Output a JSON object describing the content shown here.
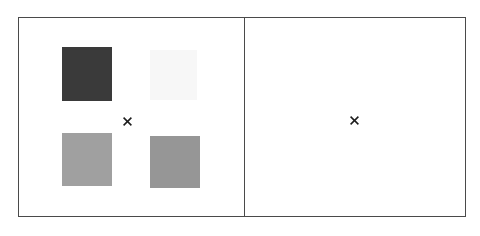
{
  "figure": {
    "background_color": "#ffffff",
    "border_color": "#4a4a4a",
    "marker_color": "#1c1c1c",
    "marker_glyph": "x"
  },
  "panels": [
    {
      "name": "left-panel",
      "label": "",
      "x": 18,
      "y": 17,
      "width": 227,
      "height": 200,
      "center_marker": {
        "label": "x",
        "cx": 127,
        "cy": 121
      },
      "swatches": [
        {
          "name": "swatch-top-left",
          "label": "",
          "color": "#3a3a3a",
          "x": 62,
          "y": 47,
          "width": 50,
          "height": 54,
          "row": 0,
          "col": 0
        },
        {
          "name": "swatch-top-right",
          "label": "",
          "color": "#f7f7f7",
          "x": 150,
          "y": 50,
          "width": 47,
          "height": 50,
          "row": 0,
          "col": 1
        },
        {
          "name": "swatch-bottom-left",
          "label": "",
          "color": "#a0a0a0",
          "x": 62,
          "y": 133,
          "width": 50,
          "height": 53,
          "row": 1,
          "col": 0
        },
        {
          "name": "swatch-bottom-right",
          "label": "",
          "color": "#969696",
          "x": 150,
          "y": 136,
          "width": 50,
          "height": 52,
          "row": 1,
          "col": 1
        }
      ]
    },
    {
      "name": "right-panel",
      "label": "",
      "x": 244,
      "y": 17,
      "width": 222,
      "height": 200,
      "center_marker": {
        "label": "x",
        "cx": 354,
        "cy": 120
      },
      "swatches": []
    }
  ]
}
